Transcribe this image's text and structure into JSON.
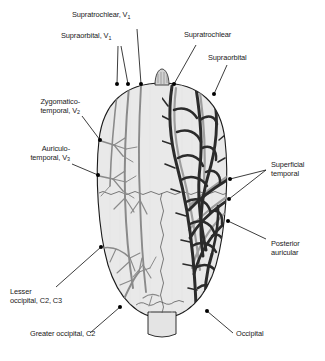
{
  "figure": {
    "view": "superior view of the head",
    "colors": {
      "scalp_fill": "#e9e9e9",
      "scalp_outline": "#1a1a1a",
      "artery_dark": "#2b2b2b",
      "nerve_gray": "#8a8a8a",
      "vein_mid": "#9a9a9a",
      "leader_line": "#1a1a1a",
      "anchor_dot": "#000000",
      "background": "#ffffff"
    },
    "structures": {
      "nose": "nose-marker",
      "neck": "neck-stub",
      "coronal_suture": "coronal-suture-line",
      "sagittal_suture": "sagittal-suture-line",
      "left_half": "nerve-distribution",
      "right_half": "arterial-distribution"
    }
  },
  "labels": [
    {
      "id": "supratrochlear-v1",
      "text_line1": "Supratrochlear, V",
      "sub1": "1",
      "text_line2": ""
    },
    {
      "id": "supraorbital-v1",
      "text_line1": "Supraorbital, V",
      "sub1": "1",
      "text_line2": ""
    },
    {
      "id": "supratrochlear",
      "text_line1": "Supratrochlear",
      "sub1": "",
      "text_line2": ""
    },
    {
      "id": "supraorbital",
      "text_line1": "Supraorbital",
      "sub1": "",
      "text_line2": ""
    },
    {
      "id": "zygomaticotemporal-v2",
      "text_line1": "Zygomatico-",
      "sub1": "2",
      "text_line2": "temporal, V"
    },
    {
      "id": "auriculotemporal-v3",
      "text_line1": "Auriculo-",
      "sub1": "3",
      "text_line2": "temporal, V"
    },
    {
      "id": "superficial-temporal",
      "text_line1": "Superficial",
      "sub1": "",
      "text_line2": "temporal"
    },
    {
      "id": "posterior-auricular",
      "text_line1": "Posterior",
      "sub1": "",
      "text_line2": "auricular"
    },
    {
      "id": "lesser-occipital",
      "text_line1": "Lesser",
      "sub1": "",
      "text_line2": "occipital, C2, C3"
    },
    {
      "id": "greater-occipital",
      "text_line1": "Greater occipital, C2",
      "sub1": "",
      "text_line2": ""
    },
    {
      "id": "occipital",
      "text_line1": "Occipital",
      "sub1": "",
      "text_line2": ""
    }
  ]
}
